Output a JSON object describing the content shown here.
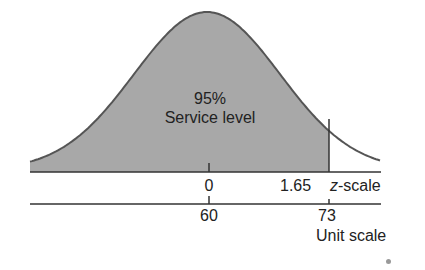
{
  "chart_data": {
    "type": "area",
    "title": "",
    "distribution": {
      "mean_units": 60,
      "z_cutoff": 1.65,
      "unit_cutoff": 73
    },
    "shaded_area_label": "95%",
    "shaded_area_sublabel": "Service level",
    "axes": [
      {
        "name": "z-scale",
        "label_italic": "z",
        "label_rest": "-scale",
        "ticks": [
          {
            "value": 0,
            "label": "0"
          },
          {
            "value": 1.65,
            "label": "1.65"
          }
        ]
      },
      {
        "name": "Unit scale",
        "label": "Unit scale",
        "ticks": [
          {
            "value": 60,
            "label": "60"
          },
          {
            "value": 73,
            "label": "73"
          }
        ]
      }
    ],
    "colors": {
      "shade": "#a8a8a8",
      "line": "#444444"
    }
  }
}
